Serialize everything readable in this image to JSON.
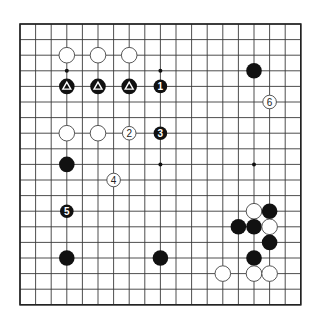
{
  "diagram": {
    "type": "go-board",
    "size": 19,
    "origin_px": [
      20,
      24
    ],
    "spacing_px": 15.6,
    "colors": {
      "black": "#111111",
      "white": "#ffffff",
      "line": "#3a3a3a"
    },
    "hoshi": [
      [
        3,
        3
      ],
      [
        9,
        3
      ],
      [
        15,
        3
      ],
      [
        3,
        9
      ],
      [
        9,
        9
      ],
      [
        15,
        9
      ],
      [
        3,
        15
      ],
      [
        9,
        15
      ],
      [
        15,
        15
      ]
    ],
    "stones": [
      {
        "col": 3,
        "row": 2,
        "color": "white",
        "label": ""
      },
      {
        "col": 5,
        "row": 2,
        "color": "white",
        "label": ""
      },
      {
        "col": 7,
        "row": 2,
        "color": "white",
        "label": ""
      },
      {
        "col": 3,
        "row": 4,
        "color": "black",
        "mark": "triangle",
        "label": ""
      },
      {
        "col": 5,
        "row": 4,
        "color": "black",
        "mark": "triangle",
        "label": ""
      },
      {
        "col": 7,
        "row": 4,
        "color": "black",
        "mark": "triangle",
        "label": ""
      },
      {
        "col": 9,
        "row": 4,
        "color": "black",
        "label": "1"
      },
      {
        "col": 15,
        "row": 3,
        "color": "black",
        "label": ""
      },
      {
        "col": 16,
        "row": 5,
        "color": "white",
        "label": "6"
      },
      {
        "col": 3,
        "row": 7,
        "color": "white",
        "label": ""
      },
      {
        "col": 5,
        "row": 7,
        "color": "white",
        "label": ""
      },
      {
        "col": 7,
        "row": 7,
        "color": "white",
        "label": "2"
      },
      {
        "col": 9,
        "row": 7,
        "color": "black",
        "label": "3"
      },
      {
        "col": 3,
        "row": 9,
        "color": "black",
        "label": ""
      },
      {
        "col": 6,
        "row": 10,
        "color": "white",
        "label": "4"
      },
      {
        "col": 3,
        "row": 12,
        "color": "black",
        "label": "5"
      },
      {
        "col": 3,
        "row": 15,
        "color": "black",
        "label": ""
      },
      {
        "col": 9,
        "row": 15,
        "color": "black",
        "label": ""
      },
      {
        "col": 15,
        "row": 12,
        "color": "white",
        "label": ""
      },
      {
        "col": 16,
        "row": 12,
        "color": "black",
        "label": ""
      },
      {
        "col": 14,
        "row": 13,
        "color": "black",
        "label": ""
      },
      {
        "col": 15,
        "row": 13,
        "color": "black",
        "label": ""
      },
      {
        "col": 16,
        "row": 13,
        "color": "white",
        "label": ""
      },
      {
        "col": 16,
        "row": 14,
        "color": "black",
        "label": ""
      },
      {
        "col": 15,
        "row": 15,
        "color": "black",
        "label": ""
      },
      {
        "col": 13,
        "row": 16,
        "color": "white",
        "label": ""
      },
      {
        "col": 15,
        "row": 16,
        "color": "white",
        "label": ""
      },
      {
        "col": 16,
        "row": 16,
        "color": "white",
        "label": ""
      }
    ]
  }
}
